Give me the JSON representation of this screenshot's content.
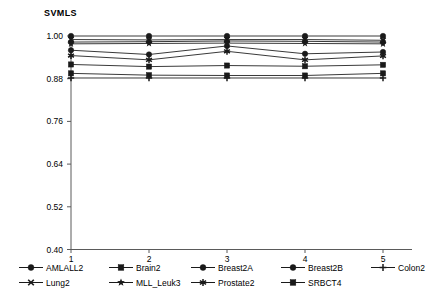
{
  "chart_data": {
    "type": "line",
    "title": "SVMLS",
    "xlabel": "",
    "ylabel": "",
    "x": [
      1,
      2,
      3,
      4,
      5
    ],
    "xtick_labels": [
      "1",
      "2",
      "3",
      "4",
      "5"
    ],
    "ytick_labels": [
      "1.00",
      "0.88",
      "0.76",
      "0.64",
      "0.52",
      "0.40"
    ],
    "ytick_values": [
      1.0,
      0.88,
      0.76,
      0.64,
      0.52,
      0.4
    ],
    "ylim": [
      0.4,
      1.0
    ],
    "xlim": [
      1,
      5
    ],
    "grid": false,
    "legend_position": "bottom",
    "series": [
      {
        "name": "AMLALL2",
        "marker": "circle",
        "values": [
          1.0,
          1.0,
          1.0,
          1.0,
          1.0
        ]
      },
      {
        "name": "Brain2",
        "marker": "square",
        "values": [
          0.895,
          0.89,
          0.889,
          0.889,
          0.895
        ]
      },
      {
        "name": "Breast2A",
        "marker": "circle",
        "values": [
          0.983,
          0.984,
          0.986,
          0.985,
          0.983
        ]
      },
      {
        "name": "Breast2B",
        "marker": "circle",
        "values": [
          0.96,
          0.948,
          0.972,
          0.95,
          0.955
        ]
      },
      {
        "name": "Colon2",
        "marker": "plus",
        "values": [
          0.882,
          0.882,
          0.882,
          0.882,
          0.882
        ]
      },
      {
        "name": "Lung2",
        "marker": "cross",
        "values": [
          0.99,
          0.989,
          0.99,
          0.99,
          0.988
        ]
      },
      {
        "name": "MLL_Leuk3",
        "marker": "star",
        "values": [
          0.978,
          0.979,
          0.98,
          0.979,
          0.978
        ]
      },
      {
        "name": "Prostate2",
        "marker": "asterisk",
        "values": [
          0.945,
          0.933,
          0.957,
          0.933,
          0.944
        ]
      },
      {
        "name": "SRBCT4",
        "marker": "square",
        "values": [
          0.92,
          0.914,
          0.917,
          0.915,
          0.919
        ]
      }
    ]
  },
  "legend": {
    "row1": [
      "AMLALL2",
      "Brain2",
      "Breast2A",
      "Breast2B",
      "Colon2"
    ],
    "row2": [
      "Lung2",
      "MLL_Leuk3",
      "Prostate2",
      "SRBCT4"
    ]
  }
}
